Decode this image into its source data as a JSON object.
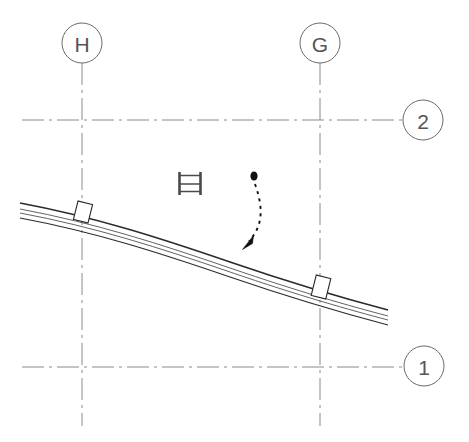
{
  "drawing": {
    "title": "Partial Floor Plan — Curved Wall at Grid G/H",
    "type": "architectural-plan-fragment",
    "background_color": "#ffffff",
    "canvas": {
      "width": 469,
      "height": 442
    }
  },
  "grid_bubbles": [
    {
      "label": "H",
      "name": "grid-bubble-h",
      "cx": 82,
      "cy": 43,
      "r": 20,
      "orientation": "vertical",
      "stroke": "#6b6b6b"
    },
    {
      "label": "G",
      "name": "grid-bubble-g",
      "cx": 320,
      "cy": 43,
      "r": 20,
      "orientation": "vertical",
      "stroke": "#6b6b6b"
    },
    {
      "label": "2",
      "name": "grid-bubble-2",
      "cx": 423,
      "cy": 120,
      "r": 20,
      "orientation": "horizontal",
      "stroke": "#6b6b6b"
    },
    {
      "label": "1",
      "name": "grid-bubble-1",
      "cx": 424,
      "cy": 366,
      "r": 20,
      "orientation": "horizontal",
      "stroke": "#6b6b6b"
    }
  ],
  "gridlines": [
    {
      "name": "gridline-h",
      "label": "H",
      "orientation": "vertical",
      "x1": 82,
      "y1": 63,
      "x2": 82,
      "y2": 426,
      "stroke": "#8a8a8a",
      "dash": "22,5,3,5"
    },
    {
      "name": "gridline-g",
      "label": "G",
      "orientation": "vertical",
      "x1": 320,
      "y1": 63,
      "x2": 320,
      "y2": 426,
      "stroke": "#8a8a8a",
      "dash": "22,5,3,5"
    },
    {
      "name": "gridline-2",
      "label": "2",
      "orientation": "horizontal",
      "x1": 22,
      "y1": 120,
      "x2": 403,
      "y2": 120,
      "stroke": "#8a8a8a",
      "dash": "22,5,3,5"
    },
    {
      "name": "gridline-1",
      "label": "1",
      "orientation": "horizontal",
      "x1": 22,
      "y1": 367,
      "x2": 404,
      "y2": 367,
      "stroke": "#8a8a8a",
      "dash": "22,5,3,5"
    }
  ],
  "wall": {
    "name": "curved-wall-assembly",
    "description": "Shallow curved multi-layer wall running from upper-left to lower-right",
    "line_count": 4,
    "stroke": "#2b2b2b",
    "layers": [
      {
        "name": "wall-face-outer",
        "stroke_width": 1.6,
        "offset": 0
      },
      {
        "name": "wall-line-2",
        "stroke_width": 0.8,
        "offset": 6
      },
      {
        "name": "wall-line-3",
        "stroke_width": 0.8,
        "offset": 10
      },
      {
        "name": "wall-face-inner",
        "stroke_width": 1.1,
        "offset": 15
      }
    ],
    "start": {
      "x": 20,
      "y": 203
    },
    "control": {
      "x": 205,
      "y": 248
    },
    "end": {
      "x": 388,
      "y": 312
    }
  },
  "columns": [
    {
      "name": "column-at-grid-h",
      "label": "",
      "cx": 83,
      "cy": 212,
      "width": 15,
      "height": 19,
      "rotation": 14,
      "stroke": "#2b2b2b",
      "fill": "#ffffff"
    },
    {
      "name": "column-at-grid-g",
      "label": "",
      "cx": 321,
      "cy": 287,
      "width": 15,
      "height": 21,
      "rotation": 14,
      "stroke": "#2b2b2b",
      "fill": "#ffffff"
    }
  ],
  "ladder_symbol": {
    "name": "ladder-symbol",
    "description": "Small ladder plan symbol",
    "x": 178,
    "y": 172,
    "width": 24,
    "height": 23,
    "rail_width": 2.6,
    "rung_count": 3,
    "stroke": "#4a4a4a"
  },
  "leader_arrow": {
    "name": "curved-leader-arrow",
    "description": "Dashed curved leader with round start dot and solid arrowhead pointing down-left",
    "dot": {
      "cx": 254,
      "cy": 176,
      "rx": 3.4,
      "ry": 4.4,
      "fill": "#111111"
    },
    "path": "M 255 183 C 262 205 264 224 247 243",
    "dash": "3,4",
    "stroke": "#111111",
    "stroke_width": 1.8,
    "arrow_tip": {
      "x": 243,
      "y": 249
    }
  },
  "colors": {
    "background": "#ffffff",
    "grid_stroke": "#8a8a8a",
    "bubble_stroke": "#6b6b6b",
    "bubble_text": "#555555",
    "wall_stroke": "#2b2b2b",
    "annotation": "#111111"
  }
}
